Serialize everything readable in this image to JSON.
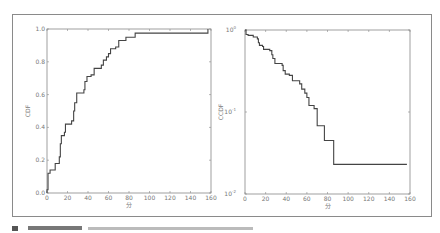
{
  "figure": {
    "caption_text": "",
    "caption_visible_but_illegible": true
  },
  "chart_data": [
    {
      "type": "line",
      "step": true,
      "title": "",
      "xlabel": "分",
      "ylabel": "CDF",
      "xlim": [
        0,
        160
      ],
      "ylim": [
        0.0,
        1.0
      ],
      "yscale": "linear",
      "grid": false,
      "xticks": [
        "0",
        "20",
        "40",
        "60",
        "80",
        "100",
        "120",
        "140",
        "160"
      ],
      "yticks": [
        "0.0",
        "0.2",
        "0.4",
        "0.6",
        "0.8",
        "1.0"
      ],
      "series": [
        {
          "name": "CDF",
          "color": "#444444",
          "x": [
            0,
            1,
            3,
            8,
            12,
            13,
            14,
            17,
            18,
            24,
            26,
            27,
            29,
            36,
            37,
            39,
            43,
            46,
            53,
            55,
            58,
            60,
            62,
            67,
            70,
            77,
            86,
            157,
            157
          ],
          "y": [
            0.02,
            0.12,
            0.14,
            0.18,
            0.22,
            0.3,
            0.35,
            0.37,
            0.42,
            0.44,
            0.5,
            0.55,
            0.61,
            0.63,
            0.68,
            0.71,
            0.72,
            0.76,
            0.78,
            0.81,
            0.83,
            0.85,
            0.88,
            0.89,
            0.93,
            0.95,
            0.975,
            0.975,
            1.0
          ]
        }
      ]
    },
    {
      "type": "line",
      "step": true,
      "title": "",
      "xlabel": "分",
      "ylabel": "CCDF",
      "xlim": [
        0,
        160
      ],
      "ylim": [
        0.01,
        1.0
      ],
      "yscale": "log",
      "grid": false,
      "xticks": [
        "0",
        "20",
        "40",
        "60",
        "80",
        "100",
        "120",
        "140",
        "160"
      ],
      "yticks": [
        "10^-2",
        "10^-1",
        "10^0"
      ],
      "series": [
        {
          "name": "CCDF",
          "color": "#444444",
          "x": [
            0,
            1,
            3,
            8,
            12,
            13,
            14,
            17,
            18,
            24,
            26,
            27,
            29,
            36,
            37,
            39,
            43,
            46,
            53,
            55,
            58,
            60,
            62,
            67,
            70,
            77,
            86,
            157
          ],
          "y": [
            1.0,
            0.88,
            0.86,
            0.82,
            0.78,
            0.7,
            0.65,
            0.63,
            0.58,
            0.56,
            0.5,
            0.45,
            0.39,
            0.37,
            0.32,
            0.29,
            0.28,
            0.24,
            0.22,
            0.19,
            0.17,
            0.15,
            0.12,
            0.11,
            0.068,
            0.045,
            0.023,
            0.023
          ]
        }
      ]
    }
  ]
}
